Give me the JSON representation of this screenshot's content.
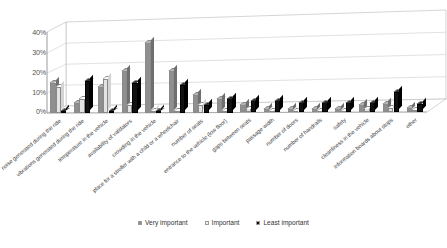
{
  "chart_data": {
    "type": "bar",
    "title": "",
    "subtitle": "",
    "xlabel": "",
    "ylabel": "",
    "ylim": [
      0,
      40
    ],
    "ytick_labels": [
      "0%",
      "10%",
      "20%",
      "30%",
      "40%"
    ],
    "ytick_values": [
      0,
      10,
      20,
      30,
      40
    ],
    "grid": true,
    "legend_position": "bottom",
    "style": "3d-clustered-column",
    "categories": [
      "noise generated during the ride",
      "vibrations generated during the ride",
      "temperature in the vehicle",
      "availability of validators",
      "crowding in the vehicle",
      "place for a stroller with a child or a wheelchair",
      "number of seats",
      "entrance to the vehicle (low floor)",
      "gaps between seats",
      "passage width",
      "number of doors",
      "number of handrails",
      "safety",
      "cleanliness in the vehicle",
      "information boards about stops",
      "other"
    ],
    "series": [
      {
        "name": "Very important",
        "color": "#8f8f8f",
        "values": [
          15,
          5,
          13,
          21,
          35,
          21,
          9,
          7,
          4,
          2,
          2,
          2,
          2,
          4,
          4,
          2
        ]
      },
      {
        "name": "Important",
        "color": "#e3e3e3",
        "values": [
          13,
          7,
          17,
          4,
          1,
          1,
          4,
          1,
          2,
          1,
          1,
          1,
          1,
          2,
          2,
          1
        ]
      },
      {
        "name": "Least important",
        "color": "#111111",
        "values": [
          1,
          16,
          1,
          15,
          1,
          14,
          4,
          7,
          6,
          6,
          5,
          5,
          5,
          5,
          10,
          4
        ]
      }
    ]
  },
  "legend": {
    "items": [
      {
        "label": "Very important",
        "color": "#8f8f8f"
      },
      {
        "label": "Important",
        "color": "#f2f2f2"
      },
      {
        "label": "Least important",
        "color": "#111111"
      }
    ]
  },
  "axis": {
    "y_ticks": [
      "40%",
      "30%",
      "20%",
      "10%",
      "0%"
    ]
  }
}
